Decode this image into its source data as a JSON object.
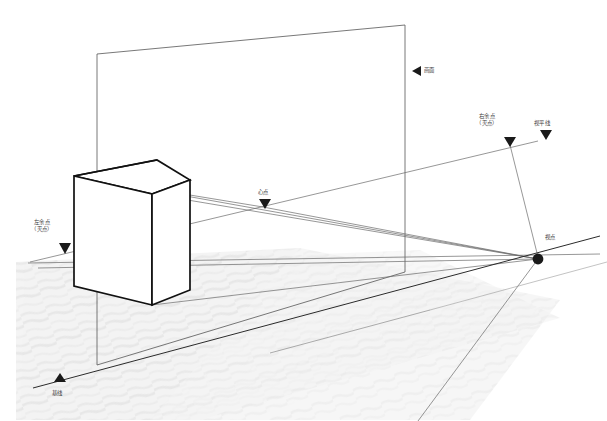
{
  "diagram": {
    "background_color": "#ffffff",
    "line_color": "#555555",
    "heavy_line_color": "#1a1a1a",
    "ground_fill": "#f2f2f2",
    "label_color": "#3a3a3a"
  },
  "labels": {
    "picture_plane": "画面",
    "right_vanishing_point_line1": "右余点",
    "right_vanishing_point_line2": "（灭点）",
    "horizon_line": "视平线",
    "center_point": "心点",
    "left_vanishing_point_line1": "左余点",
    "left_vanishing_point_line2": "（灭点）",
    "station_point": "视点",
    "ground_line": "基线"
  },
  "markers": {
    "picture_plane_marker": "left-triangle-marker",
    "right_vp_marker": "down-triangle-marker",
    "horizon_marker": "down-triangle-marker",
    "center_point_marker": "down-triangle-marker",
    "left_vp_marker": "down-triangle-marker",
    "station_point_marker": "filled-dot-marker",
    "ground_line_marker": "up-triangle-marker"
  },
  "geometry": {
    "picture_plane": {
      "top_left": [
        97,
        54
      ],
      "top_right": [
        405,
        25
      ],
      "bottom_right": [
        405,
        272
      ],
      "bottom_left": [
        97,
        365
      ]
    },
    "cube": {
      "top_left": [
        74,
        176
      ],
      "top_back": [
        157,
        160
      ],
      "top_right": [
        190,
        180
      ],
      "top_front": [
        152,
        194
      ],
      "bottom_left": [
        74,
        286
      ],
      "bottom_front": [
        152,
        305
      ],
      "bottom_right": [
        190,
        290
      ]
    },
    "station_point": [
      538,
      259
    ],
    "right_vanishing_point": [
      510,
      143
    ],
    "left_vanishing_point": [
      65,
      255
    ],
    "center_point": [
      265,
      206
    ],
    "horizon_line": {
      "from": [
        28,
        263
      ],
      "to": [
        600,
        255
      ]
    },
    "ground_line": {
      "from": [
        33,
        387
      ],
      "to": [
        600,
        236
      ]
    }
  }
}
